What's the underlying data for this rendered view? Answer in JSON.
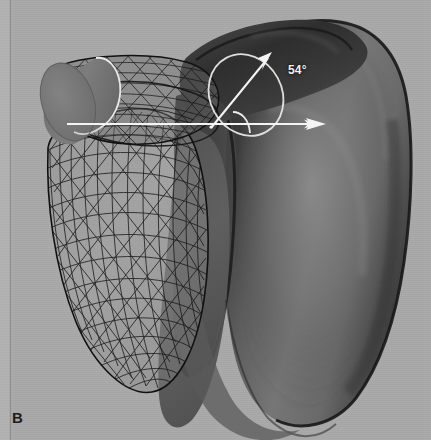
{
  "figure": {
    "panel_label": "B",
    "background_color": "#a9a9a9",
    "width": 431,
    "height": 440,
    "type": "3d-rendering"
  },
  "annotations": {
    "angle_label": "54°",
    "angle_value": 54,
    "angle_unit": "degrees",
    "annotation_color": "#f2f2f2",
    "reference_axis_name": "horizontal-reference-axis",
    "measured_axis_name": "inclination-axis"
  },
  "objects": {
    "wireframe_mesh": {
      "name": "glenoid-wireframe-mesh",
      "style": "triangulated-surface-mesh",
      "stroke_color": "#1a1a1a"
    },
    "shaded_surface": {
      "name": "humeral-head-surface",
      "style": "smooth-shaded",
      "fill_color": "#6b6b6b"
    },
    "cylinder": {
      "name": "axis-cylinder",
      "fill_color": "#757575",
      "outline_color": "#e8e8e8"
    },
    "circle_outline": {
      "name": "best-fit-circle-outline",
      "stroke_color": "#e6e6e6"
    }
  }
}
